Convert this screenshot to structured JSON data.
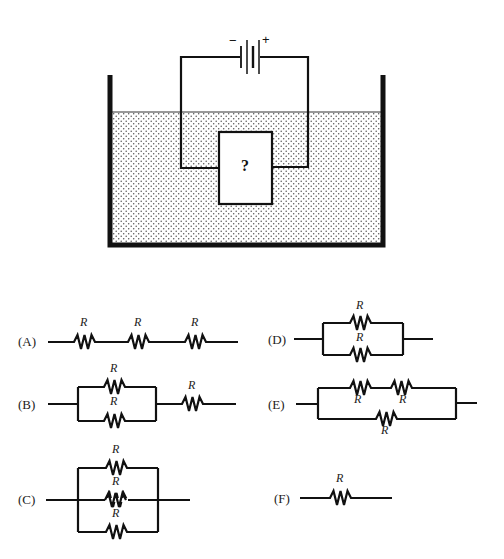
{
  "figure": {
    "battery": {
      "negative_label": "−",
      "positive_label": "+"
    },
    "unknown_box_label": "?",
    "colors": {
      "ink": "#111111",
      "background": "#ffffff",
      "water_dots": "#555555"
    }
  },
  "resistor_label": "R",
  "options": [
    {
      "id": "A",
      "label": "(A)",
      "description": "Three resistors R in series"
    },
    {
      "id": "B",
      "label": "(B)",
      "description": "Two resistors R in parallel, in series with one resistor R"
    },
    {
      "id": "C",
      "label": "(C)",
      "description": "Three resistors R in parallel"
    },
    {
      "id": "D",
      "label": "(D)",
      "description": "Two resistors R in parallel"
    },
    {
      "id": "E",
      "label": "(E)",
      "description": "Two resistors R in series, in parallel with one resistor R"
    },
    {
      "id": "F",
      "label": "(F)",
      "description": "Single resistor R"
    }
  ]
}
